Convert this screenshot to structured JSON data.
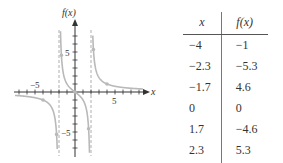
{
  "chart_data": [
    {
      "type": "line",
      "title": "",
      "function": "f(x) = 3x/(x^2 - 4)",
      "xlabel": "x",
      "ylabel": "f(x)",
      "xlim": [
        -7.5,
        9
      ],
      "ylim": [
        -8,
        8.5
      ],
      "x_tick_labels": [
        "-5",
        "5"
      ],
      "y_tick_labels": [
        "5",
        "-5"
      ],
      "vertical_asymptotes": [
        -2,
        2
      ],
      "horizontal_asymptote": 0,
      "grid": false,
      "points": [
        {
          "x": -4,
          "y": -1
        },
        {
          "x": -2.3,
          "y": -5.3
        },
        {
          "x": -1.7,
          "y": 4.6
        },
        {
          "x": 0,
          "y": 0
        },
        {
          "x": 1.7,
          "y": -4.6
        },
        {
          "x": 2.3,
          "y": 5.3
        },
        {
          "x": 4,
          "y": 1
        }
      ],
      "colors": {
        "curve": "#b9b9b9",
        "axis": "#333333",
        "asymptote": "#9a9a9a"
      }
    },
    {
      "type": "table",
      "columns": [
        "x",
        "f(x)"
      ],
      "rows": [
        [
          "−4",
          "−1"
        ],
        [
          "−2.3",
          "−5.3"
        ],
        [
          "−1.7",
          "4.6"
        ],
        [
          "0",
          "0"
        ],
        [
          "1.7",
          "−4.6"
        ],
        [
          "2.3",
          "5.3"
        ],
        [
          "4",
          "1"
        ]
      ]
    }
  ],
  "graph": {
    "x_axis_label": "x",
    "y_axis_label": "f(x)",
    "x_tick_neg": "−5",
    "x_tick_pos": "5",
    "y_tick_pos": "5",
    "y_tick_neg": "−5"
  },
  "table": {
    "header_x": "x",
    "header_fx": "f(x)",
    "rows": [
      {
        "x": "−4",
        "fx": "−1"
      },
      {
        "x": "−2.3",
        "fx": "−5.3"
      },
      {
        "x": "−1.7",
        "fx": "4.6"
      },
      {
        "x": "0",
        "fx": "0"
      },
      {
        "x": "1.7",
        "fx": "−4.6"
      },
      {
        "x": "2.3",
        "fx": "5.3"
      },
      {
        "x": "4",
        "fx": "1"
      }
    ]
  }
}
